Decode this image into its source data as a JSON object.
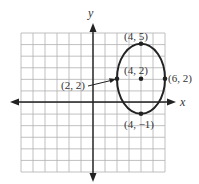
{
  "figure": {
    "axes": {
      "x_label": "x",
      "y_label": "y",
      "x_range": [
        -6,
        6
      ],
      "y_range": [
        -6,
        6
      ],
      "grid": true
    },
    "ellipse": {
      "center": [
        4,
        2
      ],
      "semi_axis_x": 2,
      "semi_axis_y": 3
    },
    "points": [
      {
        "label": "(4, 5)",
        "x": 4,
        "y": 5
      },
      {
        "label": "(4, 2)",
        "x": 4,
        "y": 2
      },
      {
        "label": "(6, 2)",
        "x": 6,
        "y": 2
      },
      {
        "label": "(2, 2)",
        "x": 2,
        "y": 2
      },
      {
        "label": "(4, −1)",
        "x": 4,
        "y": -1
      }
    ]
  }
}
